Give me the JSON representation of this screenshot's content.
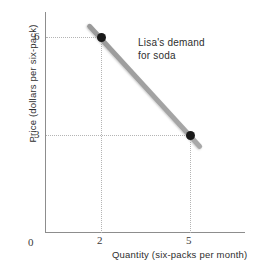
{
  "chart_data": {
    "type": "line",
    "title": "",
    "subtitle": "",
    "xlabel": "Quantity (six-packs per month)",
    "ylabel": "Price (dollars per six-pack)",
    "xlim": [
      0,
      7
    ],
    "ylim": [
      0,
      7.5
    ],
    "grid": true,
    "grid_style": "dotted guide lines from each axis to the plotted points",
    "legend": "none",
    "annotations": [
      {
        "text_line_1": "Lisa's demand",
        "text_line_2": "for soda",
        "position": "upper-right of the demand line"
      }
    ],
    "series": [
      {
        "name": "Lisa's demand for soda",
        "color": "#9a9a9a",
        "x": [
          2,
          5
        ],
        "y": [
          6,
          3
        ],
        "points": [
          {
            "label": "A",
            "quantity": 2,
            "price": 6
          },
          {
            "label": "B",
            "quantity": 5,
            "price": 3
          }
        ]
      }
    ],
    "x_ticks": [
      "0",
      "2",
      "5"
    ],
    "y_ticks": [
      "6",
      "3"
    ],
    "point_color": "#1a1a1a",
    "axis_color": "#8d8d8d",
    "grid_color": "#b4b4b4"
  },
  "axes": {
    "y_title": "Price (dollars per six-pack)",
    "x_title": "Quantity (six-packs per month)",
    "y_tick_6": "6",
    "y_tick_3": "3",
    "x_tick_0": "0",
    "x_tick_2": "2",
    "x_tick_5": "5"
  },
  "annotation": {
    "line1": "Lisa's demand",
    "line2": "for soda"
  }
}
